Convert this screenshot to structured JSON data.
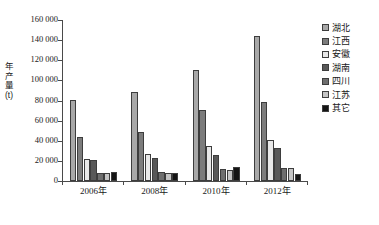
{
  "chart_data": {
    "type": "bar",
    "title": "",
    "xlabel": "",
    "ylabel": "年产量 (t)",
    "ylim": [
      0,
      160000
    ],
    "ytick_step": 20000,
    "grid": false,
    "legend_position": "right",
    "categories": [
      "2006年",
      "2008年",
      "2010年",
      "2012年"
    ],
    "ytick_labels": [
      "160 000",
      "140 000",
      "120 000",
      "100 000",
      "80 000",
      "60 000",
      "40 000",
      "20 000",
      "0"
    ],
    "ytick_values": [
      160000,
      140000,
      120000,
      100000,
      80000,
      60000,
      40000,
      20000,
      0
    ],
    "series": [
      {
        "name": "湖北",
        "color": "#a8a8a8",
        "values": [
          81000,
          88000,
          110000,
          144000
        ]
      },
      {
        "name": "江西",
        "color": "#7c7c7c",
        "values": [
          44000,
          48500,
          71000,
          79000
        ]
      },
      {
        "name": "安徽",
        "color": "#e8e8e8",
        "values": [
          22000,
          26500,
          35000,
          41000
        ]
      },
      {
        "name": "湖南",
        "color": "#585858",
        "values": [
          20500,
          22500,
          26000,
          33000
        ]
      },
      {
        "name": "四川",
        "color": "#6e6e6e",
        "values": [
          7500,
          9000,
          12000,
          13000
        ]
      },
      {
        "name": "江苏",
        "color": "#c4c4c4",
        "values": [
          7500,
          8000,
          10500,
          12500
        ]
      },
      {
        "name": "其它",
        "color": "#141414",
        "values": [
          9000,
          8000,
          14000,
          7000
        ]
      }
    ]
  },
  "axis": {
    "y_title_text": "年产量 (t)"
  }
}
